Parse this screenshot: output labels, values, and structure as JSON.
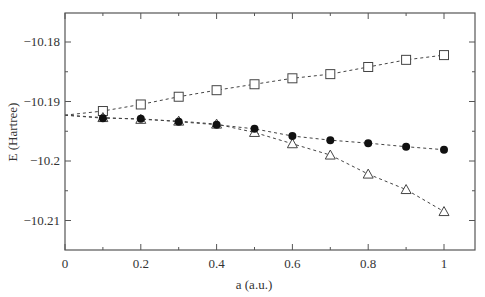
{
  "chart_data": {
    "type": "scatter",
    "title": "",
    "xlabel": "a (a.u.)",
    "ylabel": "E (Hartree)",
    "xlim": [
      0,
      1.08
    ],
    "ylim": [
      -10.2148,
      -10.1751
    ],
    "xticks": [
      0,
      0.2,
      0.4,
      0.6,
      0.8,
      1
    ],
    "xtick_labels": [
      "0",
      "0.2",
      "0.4",
      "0.6",
      "0.8",
      "1"
    ],
    "xminor": [
      0.1,
      0.3,
      0.5,
      0.7,
      0.9
    ],
    "yticks": [
      -10.18,
      -10.19,
      -10.2,
      -10.21
    ],
    "ytick_labels": [
      "−10.18",
      "−10.19",
      "−10.2",
      "−10.21"
    ],
    "yminor": [
      -10.185,
      -10.195,
      -10.205
    ],
    "grid": false,
    "legend": "none",
    "x": [
      0.1,
      0.2,
      0.3,
      0.4,
      0.5,
      0.6,
      0.7,
      0.8,
      0.9,
      1.0
    ],
    "series": [
      {
        "name": "open squares",
        "marker": "square-open",
        "line": "dashed",
        "line_start": [
          0,
          -10.1923
        ],
        "values": [
          -10.1916,
          -10.1905,
          -10.1892,
          -10.1881,
          -10.1871,
          -10.1861,
          -10.1854,
          -10.1842,
          -10.183,
          -10.1822
        ]
      },
      {
        "name": "filled circles",
        "marker": "circle-filled",
        "line": "dashed",
        "line_start": [
          0,
          -10.1923
        ],
        "values": [
          -10.1928,
          -10.1929,
          -10.1934,
          -10.1939,
          -10.1946,
          -10.1958,
          -10.1965,
          -10.197,
          -10.1976,
          -10.1981
        ]
      },
      {
        "name": "open triangles",
        "marker": "triangle-open",
        "line": "dashed",
        "line_start": [
          0,
          -10.1923
        ],
        "values": [
          -10.1927,
          -10.193,
          -10.1933,
          -10.1938,
          -10.1952,
          -10.1971,
          -10.199,
          -10.2022,
          -10.2048,
          -10.2085
        ]
      }
    ]
  }
}
